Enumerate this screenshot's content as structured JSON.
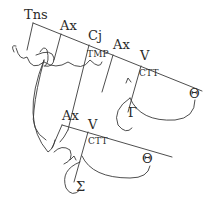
{
  "diagram": {
    "main_spine": {
      "nodes": [
        {
          "id": "tns",
          "label": "Tns"
        },
        {
          "id": "ax1",
          "label": "Ax"
        },
        {
          "id": "cj",
          "label": "Cj"
        },
        {
          "id": "ax2",
          "label": "Ax"
        },
        {
          "id": "v1",
          "label": "V"
        }
      ],
      "branch_labels": [
        {
          "id": "tmp",
          "label": "TMP"
        },
        {
          "id": "ctt1",
          "label": "CTT"
        }
      ],
      "arguments": [
        {
          "id": "theta1",
          "label": "Θ"
        },
        {
          "id": "gamma",
          "label": "Γ"
        }
      ]
    },
    "embedded_spine": {
      "nodes": [
        {
          "id": "ax3",
          "label": "Ax"
        },
        {
          "id": "v2",
          "label": "V"
        }
      ],
      "branch_labels": [
        {
          "id": "ctt2",
          "label": "CTT"
        }
      ],
      "arguments": [
        {
          "id": "theta2",
          "label": "Θ"
        },
        {
          "id": "sigma",
          "label": "Σ"
        }
      ]
    },
    "colors": {
      "line": "#3a3a3a",
      "text": "#2a2a2a",
      "background": "#ffffff"
    }
  }
}
